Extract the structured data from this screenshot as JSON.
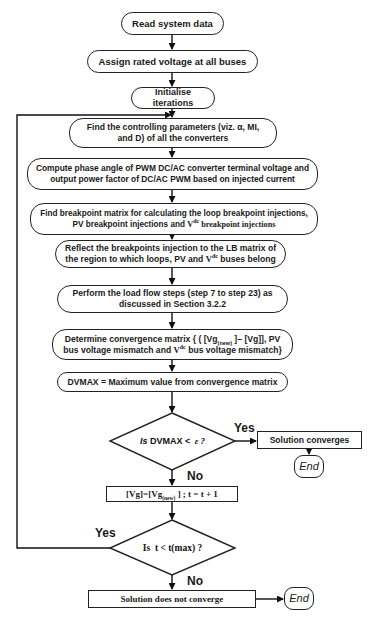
{
  "diagram": {
    "type": "flowchart",
    "nodes": {
      "start": {
        "shape": "terminator",
        "text": "Read system data"
      },
      "assign": {
        "shape": "process",
        "text": "Assign rated voltage at all buses"
      },
      "init": {
        "shape": "process",
        "text": "Initialise iterations"
      },
      "find_params": {
        "shape": "process",
        "line1": "Find the controlling parameters (viz. α, MI,",
        "line2": "and D) of all the converters"
      },
      "compute": {
        "shape": "process",
        "line1": "Compute phase angle of PWM DC/AC converter terminal voltage and",
        "line2": "output power factor of DC/AC PWM based on injected current"
      },
      "breakpoint": {
        "shape": "process",
        "line1": "Find breakpoint matrix for calculating the loop breakpoint injections,",
        "line2a": "PV breakpoint injections and ",
        "line2_v": "V",
        "line2_sup": "dc",
        "line2b": " breakpoint injections"
      },
      "reflect": {
        "shape": "process",
        "line1": "Reflect the breakpoints injection to the LB matrix of",
        "line2a": "the region to which loops,  PV and ",
        "line2_v": "V",
        "line2_sup": "dc",
        "line2b": "  buses belong"
      },
      "loadflow": {
        "shape": "process",
        "line1": "Perform the load flow steps (step 7 to step 23) as",
        "line2": "discussed in Section 3.2.2"
      },
      "convergence": {
        "shape": "process",
        "line1a": "Determine convergence matrix { ( [Vg",
        "line1_sub": "(new)",
        "line1b": " ]– [Vg]],  PV",
        "line2a": "bus voltage mismatch and ",
        "line2_v": "V",
        "line2_sup": "dc",
        "line2b": " bus voltage mismatch}"
      },
      "dvmax": {
        "shape": "process",
        "text": "DVMAX = Maximum value from convergence matrix"
      },
      "decision1": {
        "shape": "diamond",
        "text_italic": "Is",
        "text": " DVMAX < ",
        "epsilon": "ε ?"
      },
      "converges": {
        "shape": "rectangle",
        "text": "Solution converges"
      },
      "end1": {
        "shape": "terminator",
        "text": "End"
      },
      "update": {
        "shape": "rectangle",
        "text_a": "[Vg]=[Vg",
        "text_sub": "(new)",
        "text_b": " ] ; t = t + 1"
      },
      "decision2": {
        "shape": "diamond",
        "text": "Is  t < t(max) ?"
      },
      "not_converge": {
        "shape": "rectangle",
        "text": "Solution does not converge"
      },
      "end2": {
        "shape": "terminator",
        "text": "End"
      }
    },
    "edge_labels": {
      "d1_yes": "Yes",
      "d1_no": "No",
      "d2_yes": "Yes",
      "d2_no": "No"
    },
    "colors": {
      "stroke": "#222222",
      "background": "#ffffff",
      "text": "#1a1a1a"
    }
  }
}
